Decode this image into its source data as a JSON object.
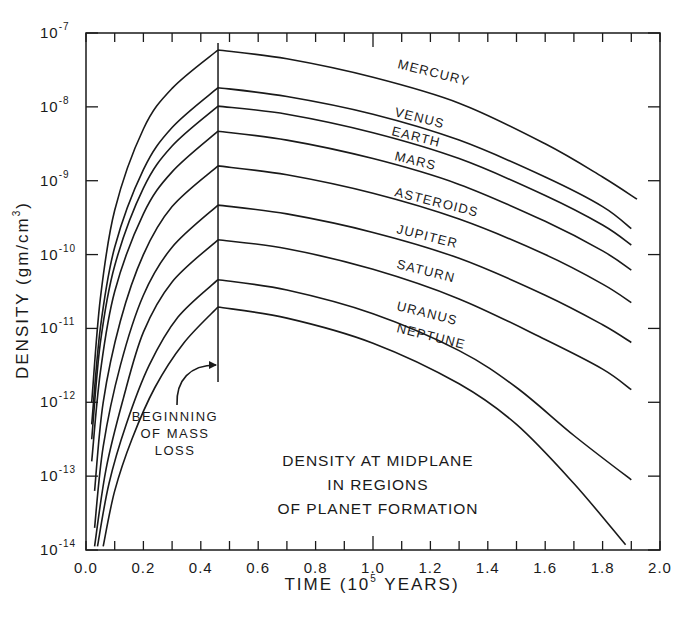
{
  "chart_data": {
    "type": "line",
    "title_lines": [
      "DENSITY AT MIDPLANE",
      "IN REGIONS",
      "OF PLANET FORMATION"
    ],
    "xlabel": "TIME (10^5 YEARS)",
    "xlabel_parts": {
      "prefix": "TIME (10",
      "exp": "5",
      "suffix": " YEARS)"
    },
    "ylabel": "DENSITY (gm/cm^3)",
    "ylabel_parts": {
      "prefix": "DENSITY (gm/cm",
      "exp": "3",
      "suffix": ")"
    },
    "xlim": [
      0.0,
      2.0
    ],
    "ylim": [
      1e-14,
      1e-07
    ],
    "yscale": "log",
    "x_ticks": [
      "0.0",
      "0.2",
      "0.4",
      "0.6",
      "0.8",
      "1.0",
      "1.2",
      "1.4",
      "1.6",
      "1.8",
      "2.0"
    ],
    "y_ticks": [
      {
        "base": "10",
        "exp": "-7"
      },
      {
        "base": "10",
        "exp": "-8"
      },
      {
        "base": "10",
        "exp": "-9"
      },
      {
        "base": "10",
        "exp": "-10"
      },
      {
        "base": "10",
        "exp": "-11"
      },
      {
        "base": "10",
        "exp": "-12"
      },
      {
        "base": "10",
        "exp": "-13"
      },
      {
        "base": "10",
        "exp": "-14"
      }
    ],
    "grid": false,
    "annotation": {
      "text_lines": [
        "BEGINNING",
        "OF MASS",
        "LOSS"
      ],
      "x": 0.46,
      "label": "BEGINNING OF MASS LOSS"
    },
    "series": [
      {
        "name": "MERCURY",
        "start_x": 0.02,
        "peak": {
          "x": 0.46,
          "log10": -7.23
        },
        "end": {
          "x": 1.92,
          "log10": -9.25
        },
        "points": [
          [
            0.02,
            -12.0
          ],
          [
            0.05,
            -10.6
          ],
          [
            0.1,
            -9.4
          ],
          [
            0.2,
            -8.3
          ],
          [
            0.3,
            -7.75
          ],
          [
            0.46,
            -7.23
          ],
          [
            0.7,
            -7.35
          ],
          [
            1.0,
            -7.6
          ],
          [
            1.3,
            -7.95
          ],
          [
            1.6,
            -8.5
          ],
          [
            1.8,
            -8.95
          ],
          [
            1.92,
            -9.25
          ]
        ]
      },
      {
        "name": "VENUS",
        "start_x": 0.02,
        "peak": {
          "x": 0.46,
          "log10": -7.74
        },
        "end": {
          "x": 1.9,
          "log10": -9.65
        },
        "points": [
          [
            0.02,
            -12.3
          ],
          [
            0.05,
            -11.0
          ],
          [
            0.1,
            -9.9
          ],
          [
            0.2,
            -8.85
          ],
          [
            0.3,
            -8.28
          ],
          [
            0.46,
            -7.74
          ],
          [
            0.7,
            -7.86
          ],
          [
            1.0,
            -8.1
          ],
          [
            1.3,
            -8.45
          ],
          [
            1.6,
            -8.95
          ],
          [
            1.8,
            -9.35
          ],
          [
            1.9,
            -9.65
          ]
        ]
      },
      {
        "name": "EARTH",
        "start_x": 0.02,
        "peak": {
          "x": 0.46,
          "log10": -7.99
        },
        "end": {
          "x": 1.9,
          "log10": -9.87
        },
        "points": [
          [
            0.02,
            -12.5
          ],
          [
            0.05,
            -11.2
          ],
          [
            0.1,
            -10.15
          ],
          [
            0.2,
            -9.1
          ],
          [
            0.3,
            -8.53
          ],
          [
            0.46,
            -7.99
          ],
          [
            0.7,
            -8.1
          ],
          [
            1.0,
            -8.35
          ],
          [
            1.3,
            -8.7
          ],
          [
            1.6,
            -9.2
          ],
          [
            1.8,
            -9.6
          ],
          [
            1.9,
            -9.87
          ]
        ]
      },
      {
        "name": "MARS",
        "start_x": 0.02,
        "peak": {
          "x": 0.46,
          "log10": -8.33
        },
        "end": {
          "x": 1.9,
          "log10": -10.21
        },
        "points": [
          [
            0.02,
            -12.8
          ],
          [
            0.05,
            -11.6
          ],
          [
            0.1,
            -10.5
          ],
          [
            0.2,
            -9.45
          ],
          [
            0.3,
            -8.88
          ],
          [
            0.46,
            -8.33
          ],
          [
            0.7,
            -8.45
          ],
          [
            1.0,
            -8.7
          ],
          [
            1.3,
            -9.05
          ],
          [
            1.6,
            -9.55
          ],
          [
            1.8,
            -9.95
          ],
          [
            1.9,
            -10.21
          ]
        ]
      },
      {
        "name": "ASTEROIDS",
        "start_x": 0.03,
        "peak": {
          "x": 0.46,
          "log10": -8.8
        },
        "end": {
          "x": 1.9,
          "log10": -10.65
        },
        "points": [
          [
            0.03,
            -13.2
          ],
          [
            0.06,
            -12.0
          ],
          [
            0.12,
            -10.9
          ],
          [
            0.2,
            -10.0
          ],
          [
            0.3,
            -9.35
          ],
          [
            0.46,
            -8.8
          ],
          [
            0.7,
            -8.92
          ],
          [
            1.0,
            -9.17
          ],
          [
            1.3,
            -9.52
          ],
          [
            1.6,
            -10.0
          ],
          [
            1.8,
            -10.4
          ],
          [
            1.9,
            -10.65
          ]
        ]
      },
      {
        "name": "JUPITER",
        "start_x": 0.03,
        "peak": {
          "x": 0.46,
          "log10": -9.33
        },
        "end": {
          "x": 1.9,
          "log10": -11.19
        },
        "points": [
          [
            0.03,
            -13.7
          ],
          [
            0.06,
            -12.6
          ],
          [
            0.12,
            -11.5
          ],
          [
            0.2,
            -10.55
          ],
          [
            0.3,
            -9.9
          ],
          [
            0.46,
            -9.33
          ],
          [
            0.7,
            -9.45
          ],
          [
            1.0,
            -9.7
          ],
          [
            1.3,
            -10.05
          ],
          [
            1.6,
            -10.55
          ],
          [
            1.8,
            -10.95
          ],
          [
            1.9,
            -11.19
          ]
        ]
      },
      {
        "name": "SATURN",
        "start_x": 0.03,
        "peak": {
          "x": 0.46,
          "log10": -9.8
        },
        "end": {
          "x": 1.9,
          "log10": -11.83
        },
        "points": [
          [
            0.03,
            -13.95
          ],
          [
            0.07,
            -12.9
          ],
          [
            0.13,
            -11.95
          ],
          [
            0.2,
            -11.05
          ],
          [
            0.3,
            -10.37
          ],
          [
            0.46,
            -9.8
          ],
          [
            0.7,
            -9.92
          ],
          [
            1.0,
            -10.2
          ],
          [
            1.3,
            -10.6
          ],
          [
            1.6,
            -11.15
          ],
          [
            1.8,
            -11.55
          ],
          [
            1.9,
            -11.83
          ]
        ]
      },
      {
        "name": "URANUS",
        "start_x": 0.04,
        "peak": {
          "x": 0.46,
          "log10": -10.34
        },
        "end": {
          "x": 1.9,
          "log10": -13.05
        },
        "points": [
          [
            0.04,
            -13.95
          ],
          [
            0.08,
            -13.1
          ],
          [
            0.14,
            -12.3
          ],
          [
            0.22,
            -11.5
          ],
          [
            0.32,
            -10.85
          ],
          [
            0.46,
            -10.34
          ],
          [
            0.7,
            -10.48
          ],
          [
            1.0,
            -10.8
          ],
          [
            1.3,
            -11.3
          ],
          [
            1.5,
            -11.8
          ],
          [
            1.7,
            -12.45
          ],
          [
            1.9,
            -13.05
          ]
        ]
      },
      {
        "name": "NEPTUNE",
        "start_x": 0.06,
        "peak": {
          "x": 0.46,
          "log10": -10.71
        },
        "end": {
          "x": 1.88,
          "log10": -13.93
        },
        "points": [
          [
            0.06,
            -13.95
          ],
          [
            0.1,
            -13.2
          ],
          [
            0.16,
            -12.5
          ],
          [
            0.24,
            -11.8
          ],
          [
            0.34,
            -11.2
          ],
          [
            0.46,
            -10.71
          ],
          [
            0.7,
            -10.86
          ],
          [
            1.0,
            -11.2
          ],
          [
            1.3,
            -11.75
          ],
          [
            1.5,
            -12.3
          ],
          [
            1.7,
            -13.1
          ],
          [
            1.88,
            -13.93
          ]
        ]
      }
    ],
    "label_positions": [
      {
        "name": "MERCURY",
        "x": 397,
        "y": 68,
        "rot": 14
      },
      {
        "name": "VENUS",
        "x": 394,
        "y": 116,
        "rot": 14
      },
      {
        "name": "EARTH",
        "x": 391,
        "y": 135,
        "rot": 14
      },
      {
        "name": "MARS",
        "x": 394,
        "y": 160,
        "rot": 14
      },
      {
        "name": "ASTEROIDS",
        "x": 394,
        "y": 196,
        "rot": 14
      },
      {
        "name": "JUPITER",
        "x": 396,
        "y": 233,
        "rot": 14
      },
      {
        "name": "SATURN",
        "x": 396,
        "y": 268,
        "rot": 14
      },
      {
        "name": "URANUS",
        "x": 396,
        "y": 310,
        "rot": 14
      },
      {
        "name": "NEPTUNE",
        "x": 396,
        "y": 332,
        "rot": 14
      }
    ]
  }
}
